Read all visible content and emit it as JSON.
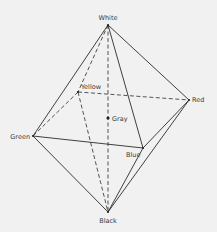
{
  "diagram": {
    "vertices": [
      {
        "id": "white",
        "label": "White"
      },
      {
        "id": "yellow",
        "label": "Yellow"
      },
      {
        "id": "red",
        "label": "Red"
      },
      {
        "id": "gray",
        "label": "Gray"
      },
      {
        "id": "green",
        "label": "Green"
      },
      {
        "id": "blue",
        "label": "Blue"
      },
      {
        "id": "black",
        "label": "Black"
      }
    ],
    "edges": [
      {
        "from": "white",
        "to": "green",
        "style": "solid"
      },
      {
        "from": "white",
        "to": "red",
        "style": "solid"
      },
      {
        "from": "white",
        "to": "blue",
        "style": "solid"
      },
      {
        "from": "green",
        "to": "blue",
        "style": "solid"
      },
      {
        "from": "green",
        "to": "black",
        "style": "solid"
      },
      {
        "from": "blue",
        "to": "black",
        "style": "solid"
      },
      {
        "from": "red",
        "to": "blue",
        "style": "solid"
      },
      {
        "from": "red",
        "to": "black",
        "style": "solid"
      },
      {
        "from": "white",
        "to": "yellow",
        "style": "dashed"
      },
      {
        "from": "yellow",
        "to": "red",
        "style": "dashed"
      },
      {
        "from": "yellow",
        "to": "green",
        "style": "dashed"
      },
      {
        "from": "yellow",
        "to": "black",
        "style": "dashed"
      },
      {
        "from": "white",
        "to": "black",
        "style": "dashed"
      }
    ]
  }
}
